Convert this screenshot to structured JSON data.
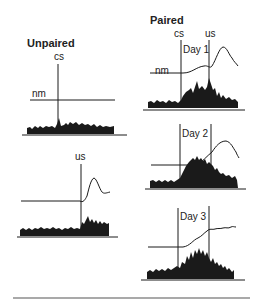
{
  "figure": {
    "groups": [
      {
        "title": "Unpaired",
        "panels": [
          {
            "id": "unpaired-cs",
            "event_label": "cs",
            "baseline_label": "nm"
          },
          {
            "id": "unpaired-us",
            "event_label": "us"
          }
        ]
      },
      {
        "title": "Paired",
        "event_labels": [
          "cs",
          "us"
        ],
        "panels": [
          {
            "id": "paired-day1",
            "day_label": "Day 1",
            "baseline_label": "nm"
          },
          {
            "id": "paired-day2",
            "day_label": "Day 2"
          },
          {
            "id": "paired-day3",
            "day_label": "Day 3"
          }
        ]
      }
    ]
  },
  "colors": {
    "ink": "#1a1a1a",
    "paper": "#ffffff"
  }
}
